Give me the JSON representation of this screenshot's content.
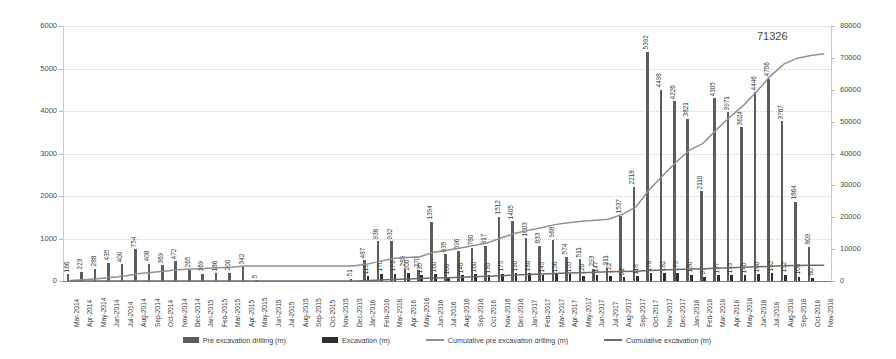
{
  "chart_data": {
    "type": "bar",
    "title": "",
    "subtitle": "",
    "xlabel": "",
    "ylabel": "",
    "y2label": "",
    "ylim": [
      0,
      6000
    ],
    "y2lim": [
      0,
      80000
    ],
    "yticks": [
      "0",
      "1000",
      "2000",
      "3000",
      "4000",
      "5000",
      "6000"
    ],
    "y2ticks": [
      "0",
      "10000",
      "20000",
      "30000",
      "40000",
      "50000",
      "60000",
      "70000",
      "80000"
    ],
    "grid": true,
    "legend_position": "bottom",
    "categories": [
      "Mar-2014",
      "Apr-2014",
      "May-2014",
      "Jun-2014",
      "Jul-2014",
      "Aug-2014",
      "Sep-2014",
      "Oct-2014",
      "Nov-2014",
      "Dec-2014",
      "Jan-2015",
      "Feb-2015",
      "Mar-2015",
      "Apr-2015",
      "May-2015",
      "Jun-2015",
      "Jul-2015",
      "Aug-2015",
      "Sep-2015",
      "Oct-2015",
      "Nov-2015",
      "Dec-2015",
      "Jan-2016",
      "Feb-2016",
      "Mar-2016",
      "Apr-2016",
      "May-2016",
      "Jun-2016",
      "Jul-2016",
      "Aug-2016",
      "Sep-2016",
      "Oct-2016",
      "Nov-2016",
      "Dec-2016",
      "Jan-2017",
      "Feb-2017",
      "Mar-2017",
      "Apr-2017",
      "May-2017",
      "Jun-2017",
      "Jul-2017",
      "Aug-2017",
      "Sep-2017",
      "Oct-2017",
      "Nov-2017",
      "Dec-2017",
      "Jan-2018",
      "Feb-2018",
      "Mar-2018",
      "Apr-2018",
      "May-2018",
      "Jun-2018",
      "Jul-2018",
      "Aug-2018",
      "Sep-2018",
      "Oct-2018",
      "Nov-2018"
    ],
    "series": [
      {
        "name": "Pre excavation drilling (m)",
        "type": "bar",
        "color": "#5c5c5c",
        "axis": "left",
        "values": [
          166,
          223,
          288,
          435,
          400,
          754,
          408,
          369,
          472,
          265,
          169,
          186,
          200,
          342,
          5,
          0,
          0,
          0,
          0,
          0,
          0,
          51,
          487,
          936,
          932,
          285,
          270,
          1394,
          635,
          696,
          780,
          817,
          1512,
          1405,
          1003,
          833,
          968,
          574,
          511,
          293,
          311,
          1537,
          2218,
          5392,
          4498,
          4226,
          3821,
          2110,
          4305,
          3971,
          3624,
          4446,
          4756,
          3767,
          1864,
          809,
          0
        ],
        "labels": [
          "166",
          "223",
          "288",
          "435",
          "400",
          "754",
          "408",
          "369",
          "472",
          "265",
          "169",
          "186",
          "200",
          "342",
          "5",
          "",
          "",
          "",
          "",
          "",
          "",
          "51",
          "487",
          "936",
          "932",
          "285",
          "270",
          "1394",
          "635",
          "696",
          "780",
          "817",
          "1512",
          "1405",
          "1003",
          "833",
          "968",
          "574",
          "511",
          "293",
          "311",
          "1537",
          "2218",
          "5392",
          "4498",
          "4226",
          "3821",
          "2110",
          "4305",
          "3971",
          "3624",
          "4446",
          "4756",
          "3767",
          "1864",
          "809",
          ""
        ]
      },
      {
        "name": "Excavation (m)",
        "type": "bar",
        "color": "#2f2f2f",
        "axis": "left",
        "values": [
          0,
          0,
          0,
          0,
          0,
          0,
          0,
          0,
          0,
          0,
          0,
          0,
          0,
          0,
          0,
          0,
          0,
          0,
          0,
          0,
          0,
          0,
          115,
          170,
          173,
          200,
          135,
          160,
          100,
          140,
          160,
          130,
          175,
          190,
          180,
          145,
          156,
          155,
          120,
          147,
          122,
          91,
          118,
          178,
          182,
          179,
          150,
          97,
          137,
          133,
          140,
          160,
          182,
          152,
          100,
          80,
          0
        ],
        "labels": [
          "",
          "",
          "",
          "",
          "",
          "",
          "",
          "",
          "",
          "",
          "",
          "",
          "",
          "",
          "",
          "",
          "",
          "",
          "",
          "",
          "",
          "",
          "115",
          "170",
          "173",
          "200",
          "135",
          "160",
          "100",
          "140",
          "160",
          "130",
          "175",
          "190",
          "180",
          "145",
          "156",
          "155",
          "120",
          "147",
          "122",
          "91",
          "118",
          "178",
          "182",
          "179",
          "150",
          "97",
          "137",
          "133",
          "140",
          "160",
          "182",
          "152",
          "100",
          "80",
          ""
        ]
      },
      {
        "name": "Cumulative pre excavation drilling (m)",
        "type": "line",
        "color": "#8f8f8f",
        "axis": "right",
        "values": [
          166,
          389,
          677,
          1112,
          1512,
          2266,
          2674,
          3043,
          3515,
          3780,
          3949,
          4135,
          4335,
          4677,
          4682,
          4682,
          4682,
          4682,
          4682,
          4682,
          4682,
          4733,
          5220,
          6156,
          7088,
          7373,
          7643,
          9037,
          9672,
          10368,
          11148,
          11965,
          13477,
          14882,
          15885,
          16718,
          17686,
          18260,
          18771,
          19064,
          19375,
          20912,
          23130,
          28522,
          33020,
          37246,
          41067,
          43177,
          47482,
          51453,
          55077,
          59523,
          64279,
          68046,
          69910,
          70719,
          71326
        ]
      },
      {
        "name": "Cumulative excavation (m)",
        "type": "line",
        "color": "#6b6b6b",
        "axis": "right",
        "values": [
          0,
          0,
          0,
          0,
          0,
          0,
          0,
          0,
          0,
          0,
          0,
          0,
          0,
          0,
          0,
          0,
          0,
          0,
          0,
          0,
          0,
          0,
          115,
          285,
          458,
          658,
          793,
          953,
          1053,
          1193,
          1353,
          1483,
          1658,
          1848,
          2028,
          2173,
          2329,
          2484,
          2604,
          2751,
          2873,
          2964,
          3082,
          3260,
          3442,
          3621,
          3771,
          3868,
          4005,
          4138,
          4278,
          4438,
          4620,
          4772,
          4872,
          4952,
          4952
        ]
      }
    ],
    "annotations": [
      {
        "text": "71326",
        "series": "Cumulative pre excavation drilling (m)",
        "at_category": "Nov-2018"
      }
    ]
  },
  "legend": {
    "items": [
      {
        "label": "Pre excavation drilling (m)",
        "marker": "bar",
        "color": "#5c5c5c"
      },
      {
        "label": "Excavation (m)",
        "marker": "bar",
        "color": "#2f2f2f"
      },
      {
        "label": "Cumulative pre excavation drilling (m)",
        "marker": "line",
        "color": "#8f8f8f"
      },
      {
        "label": "Cumulative excavation (m)",
        "marker": "line",
        "color": "#6b6b6b"
      }
    ]
  }
}
